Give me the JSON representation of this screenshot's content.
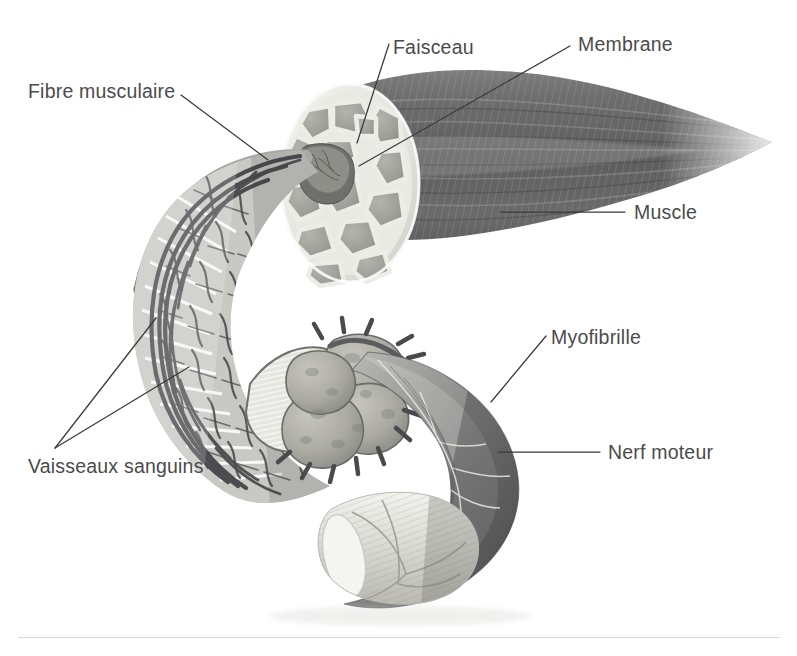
{
  "figure": {
    "kind": "anatomical-illustration",
    "language": "fr",
    "background_color": "#ffffff",
    "label_color": "#4b4b4b",
    "leader_line_color": "#3a3a3a"
  },
  "labels": {
    "fibre_musculaire": "Fibre musculaire",
    "faisceau": "Faisceau",
    "membrane": "Membrane",
    "muscle": "Muscle",
    "myofibrille": "Myofibrille",
    "nerf_moteur": "Nerf moteur",
    "vaisseaux_sanguins": "Vaisseaux sanguins"
  },
  "parts": [
    {
      "id": "muscle-belly",
      "label": "Muscle",
      "description": "corps musculaire fusiforme strié, gris foncé, s'effilant vers la droite",
      "color": "#6d6d6d"
    },
    {
      "id": "cross-section",
      "label": "Faisceau",
      "description": "coupe transversale montrant les faisceaux polygonaux",
      "color": "#a3a3a3"
    },
    {
      "id": "membrane",
      "label": "Membrane",
      "description": "gaine conjonctive claire entourant chaque faisceau",
      "color": "#e8e8e4"
    },
    {
      "id": "muscle-fiber",
      "label": "Fibre musculaire",
      "description": "fibre cylindrique unique sortant de la coupe, recourbée vers le bas",
      "color": "#8d8d8d"
    },
    {
      "id": "capillary-network",
      "label": "Vaisseaux sanguins",
      "description": "réseau capillaire dense enveloppant la fibre musculaire",
      "color": "#55555a"
    },
    {
      "id": "myofibril",
      "label": "Myofibrille",
      "description": "cylindre clair strié issu de la fibre, en bas à droite",
      "color": "#d7d7d2"
    },
    {
      "id": "motor-nerve",
      "label": "Nerf moteur",
      "description": "nerf moteur en arc se terminant sur la fibre musculaire",
      "color": "#808084"
    }
  ],
  "leaders": [
    {
      "from": "Fibre musculaire",
      "to": "muscle-fiber",
      "points": [
        [
          181,
          95
        ],
        [
          268,
          160
        ]
      ]
    },
    {
      "from": "Faisceau",
      "to": "cross-section",
      "points": [
        [
          389,
          44
        ],
        [
          357,
          143
        ]
      ]
    },
    {
      "from": "Membrane",
      "to": "membrane",
      "points": [
        [
          570,
          46
        ],
        [
          359,
          166
        ]
      ]
    },
    {
      "from": "Muscle",
      "to": "muscle-belly",
      "points": [
        [
          625,
          212
        ],
        [
          500,
          212
        ]
      ]
    },
    {
      "from": "Myofibrille",
      "to": "myofibril",
      "points": [
        [
          546,
          336
        ],
        [
          491,
          402
        ]
      ]
    },
    {
      "from": "Nerf moteur",
      "to": "motor-nerve",
      "points": [
        [
          600,
          452
        ],
        [
          498,
          452
        ]
      ]
    },
    {
      "from": "Vaisseaux sanguins",
      "to": "capillary-network",
      "points": [
        [
          55,
          448
        ],
        [
          156,
          318
        ]
      ]
    },
    {
      "from": "Vaisseaux sanguins",
      "to": "capillary-network",
      "points": [
        [
          55,
          448
        ],
        [
          189,
          367
        ]
      ]
    }
  ],
  "footer_rule": {
    "visible": true
  }
}
